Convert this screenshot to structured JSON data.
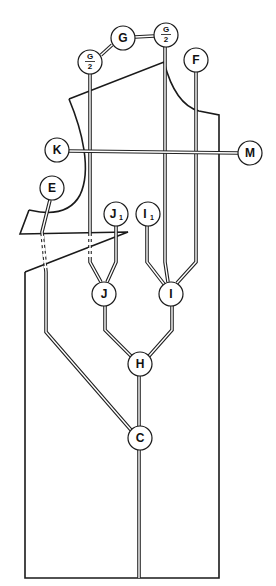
{
  "diagram": {
    "nodes": [
      {
        "id": "G",
        "label": "G",
        "x": 123,
        "y": 38
      },
      {
        "id": "G2R",
        "label": "G",
        "denominator": "2",
        "x": 166,
        "y": 35
      },
      {
        "id": "G2L",
        "label": "G",
        "denominator": "2",
        "x": 90,
        "y": 62
      },
      {
        "id": "F",
        "label": "F",
        "x": 196,
        "y": 60
      },
      {
        "id": "K",
        "label": "K",
        "x": 57,
        "y": 150
      },
      {
        "id": "M",
        "label": "M",
        "x": 250,
        "y": 153
      },
      {
        "id": "E",
        "label": "E",
        "x": 52,
        "y": 188
      },
      {
        "id": "J1",
        "label": "J",
        "subscript": "1",
        "x": 116,
        "y": 214
      },
      {
        "id": "I1",
        "label": "I",
        "subscript": "1",
        "x": 148,
        "y": 214
      },
      {
        "id": "J",
        "label": "J",
        "x": 104,
        "y": 294
      },
      {
        "id": "I",
        "label": "I",
        "x": 171,
        "y": 294
      },
      {
        "id": "H",
        "label": "H",
        "x": 140,
        "y": 364
      },
      {
        "id": "C",
        "label": "C",
        "x": 140,
        "y": 438
      }
    ],
    "caption": ""
  }
}
